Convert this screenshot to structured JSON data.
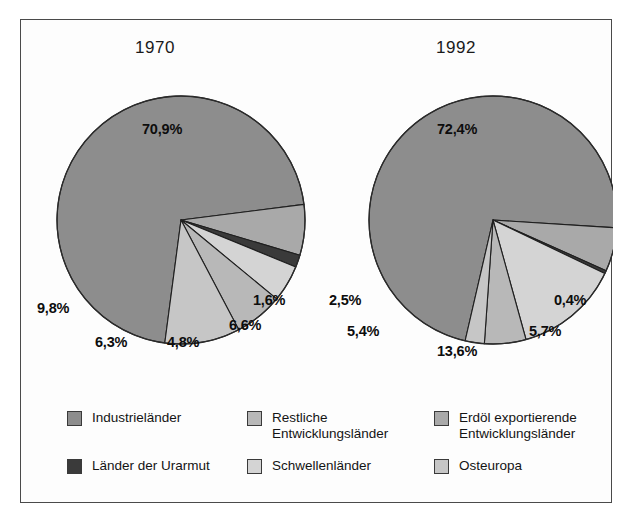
{
  "figure": {
    "frame_border_color": "#4a4a4a",
    "background_color": "#fdfdfd"
  },
  "chart_data": [
    {
      "type": "pie",
      "title": "1970",
      "categories": [
        "Industrieländer",
        "Erdöl exportierende Entwicklungsländer",
        "Länder der Urarmut",
        "Schwellenländer",
        "Restliche Entwicklungsländer",
        "Osteuropa"
      ],
      "values": [
        70.9,
        6.6,
        1.6,
        4.8,
        6.3,
        9.8
      ],
      "labels": [
        "70,9%",
        "6,6%",
        "1,6%",
        "4,8%",
        "6,3%",
        "9,8%"
      ],
      "colors": [
        "#8d8d8d",
        "#a9a9a9",
        "#3a3a3a",
        "#d4d4d4",
        "#b8b8b8",
        "#c6c6c6"
      ],
      "xlabel": "",
      "ylabel": "",
      "legend": "bottom"
    },
    {
      "type": "pie",
      "title": "1992",
      "categories": [
        "Industrieländer",
        "Erdöl exportierende Entwicklungsländer",
        "Länder der Urarmut",
        "Schwellenländer",
        "Restliche Entwicklungsländer",
        "Osteuropa"
      ],
      "values": [
        72.4,
        5.7,
        0.4,
        13.6,
        5.4,
        2.5
      ],
      "labels": [
        "72,4%",
        "5,7%",
        "0,4%",
        "13,6%",
        "5,4%",
        "2,5%"
      ],
      "colors": [
        "#8d8d8d",
        "#a9a9a9",
        "#3a3a3a",
        "#d4d4d4",
        "#b8b8b8",
        "#c6c6c6"
      ],
      "xlabel": "",
      "ylabel": "",
      "legend": "bottom"
    }
  ],
  "charts": {
    "left": {
      "title": "1970",
      "slices": {
        "industrie": "70,9%",
        "osteuropa": "9,8%",
        "restliche": "6,3%",
        "schwellen": "4,8%",
        "erdoel": "6,6%",
        "urarmut": "1,6%"
      }
    },
    "right": {
      "title": "1992",
      "slices": {
        "industrie": "72,4%",
        "osteuropa": "2,5%",
        "restliche": "5,4%",
        "schwellen": "13,6%",
        "erdoel": "5,7%",
        "urarmut": "0,4%"
      }
    }
  },
  "legend": {
    "items": [
      {
        "label": "Industrieländer",
        "color": "#8d8d8d"
      },
      {
        "label": "Restliche\nEntwicklungsländer",
        "color": "#b8b8b8"
      },
      {
        "label": "Erdöl exportierende\nEntwicklungsländer",
        "color": "#a9a9a9"
      },
      {
        "label": "Länder der Urarmut",
        "color": "#3a3a3a"
      },
      {
        "label": "Schwellenländer",
        "color": "#d4d4d4"
      },
      {
        "label": "Osteuropa",
        "color": "#c6c6c6"
      }
    ]
  }
}
